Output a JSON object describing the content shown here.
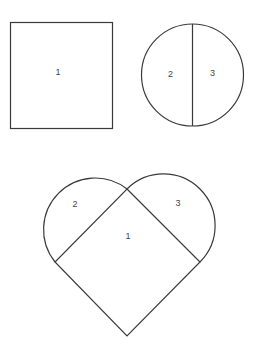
{
  "diagram": {
    "square": {
      "label": "1"
    },
    "circle": {
      "left_label": "2",
      "right_label": "3"
    },
    "heart": {
      "center_label": "1",
      "left_lobe_label": "2",
      "right_lobe_label": "3"
    }
  }
}
